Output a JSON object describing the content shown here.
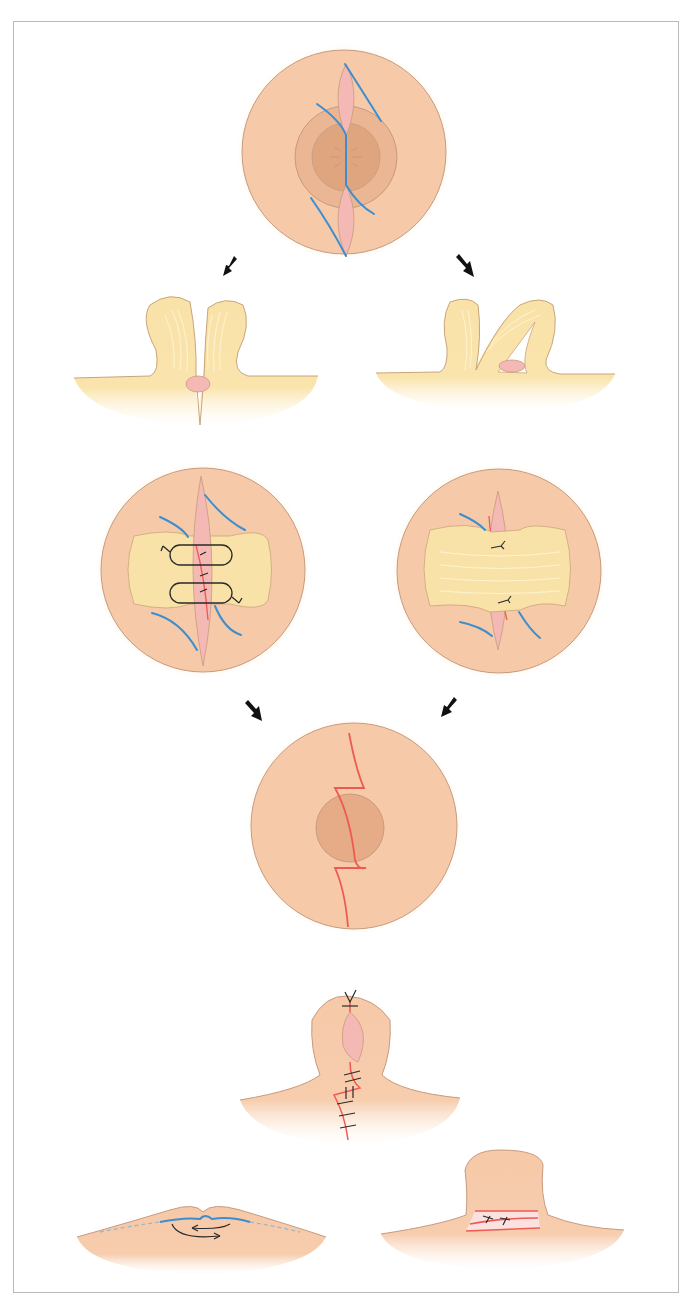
{
  "figure": {
    "type": "surgical-illustration",
    "colors": {
      "skin": "#f6c9a8",
      "skin_edge": "#c89a7e",
      "areola": "#e8b28c",
      "nipple_core": "#dea57f",
      "flap": "#f9e2a8",
      "flap_edge": "#c9a57a",
      "wound": "#f4b8b5",
      "incision_blue": "#3b8ed0",
      "suture_red": "#ee5a52",
      "suture_black": "#2a2a2a",
      "arrow": "#111111",
      "frame": "#b9b9b9"
    },
    "panels": [
      {
        "id": "top-view-incisions",
        "label": ""
      },
      {
        "id": "side-view-split-flaps",
        "label": ""
      },
      {
        "id": "side-view-crossed-flaps",
        "label": ""
      },
      {
        "id": "top-view-sutured-flaps",
        "label": ""
      },
      {
        "id": "top-view-flap-bridge",
        "label": ""
      },
      {
        "id": "top-view-zplasty-result",
        "label": ""
      },
      {
        "id": "side-view-everted-result",
        "label": ""
      },
      {
        "id": "side-view-inverted-nipple",
        "label": ""
      },
      {
        "id": "side-view-everted-band",
        "label": ""
      }
    ],
    "arrows": [
      {
        "direction": "down-left"
      },
      {
        "direction": "down-right"
      },
      {
        "direction": "down-right"
      },
      {
        "direction": "down-left"
      }
    ]
  }
}
